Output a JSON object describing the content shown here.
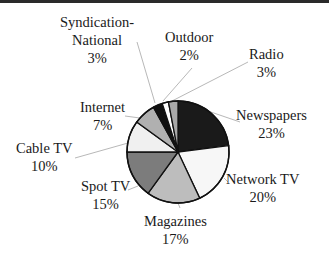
{
  "chart_data": {
    "type": "pie",
    "title": "",
    "categories": [
      "Newspapers",
      "Network TV",
      "Magazines",
      "Spot TV",
      "Cable TV",
      "Internet",
      "Syndication-National",
      "Outdoor",
      "Radio"
    ],
    "values": [
      23,
      20,
      17,
      15,
      10,
      7,
      3,
      2,
      3
    ],
    "unit": "%",
    "colors": [
      "#1a1a1a",
      "#f7f7f7",
      "#bdbdbd",
      "#7c7c7c",
      "#f0f0f0",
      "#b0b0b0",
      "#111111",
      "#ffffff",
      "#a8a8a8"
    ],
    "legend": "none (labels with leader lines)"
  },
  "labels": [
    {
      "name": "Newspapers",
      "pct": "23%"
    },
    {
      "name": "Network TV",
      "pct": "20%"
    },
    {
      "name": "Magazines",
      "pct": "17%"
    },
    {
      "name": "Spot TV",
      "pct": "15%"
    },
    {
      "name": "Cable TV",
      "pct": "10%"
    },
    {
      "name": "Internet",
      "pct": "7%"
    },
    {
      "name": "Syndication-",
      "name2": "National",
      "pct": "3%"
    },
    {
      "name": "Outdoor",
      "pct": "2%"
    },
    {
      "name": "Radio",
      "pct": "3%"
    }
  ]
}
